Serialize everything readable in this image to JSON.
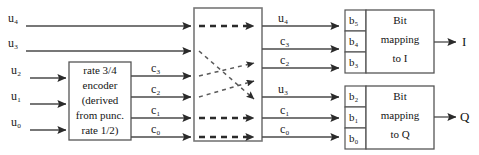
{
  "diagram": {
    "colors": {
      "background": "#ffffff",
      "line": "#4a4a4a",
      "box_stroke": "#555555",
      "text": "#141414",
      "dashed_line": "#6e6e6e"
    }
  },
  "inputs": {
    "u4": "u₄",
    "u3": "u₃",
    "u2": "u₂",
    "u1": "u₁",
    "u0": "u₀"
  },
  "encoder": {
    "name": "rate-3-4-encoder",
    "lines": [
      "rate 3/4",
      "encoder",
      "(derived",
      "from punc.",
      "rate 1/2)"
    ],
    "outputs": {
      "c3": "c₃",
      "c2": "c₂",
      "c1": "c₁",
      "c0": "c₀"
    }
  },
  "interleaver": {
    "name": "bit-interleaver",
    "label": "",
    "rows": 6,
    "straight_rows": [
      1,
      5,
      6
    ],
    "crossed_rows": [
      2,
      3,
      4,
      5
    ]
  },
  "interleaver_outputs": {
    "row1": "u₄",
    "row2": "c₃",
    "row3": "c₂",
    "row4": "u₃",
    "row5": "c₁",
    "row6": "c₀"
  },
  "registers": {
    "i_branch": [
      "b₅",
      "b₄",
      "b₃"
    ],
    "q_branch": [
      "b₂",
      "b₁",
      "b₀"
    ]
  },
  "mapping_blocks": {
    "i": {
      "lines": [
        "Bit",
        "mapping",
        "to I"
      ],
      "output": "I"
    },
    "q": {
      "lines": [
        "Bit",
        "mapping",
        "to Q"
      ],
      "output": "Q"
    }
  }
}
